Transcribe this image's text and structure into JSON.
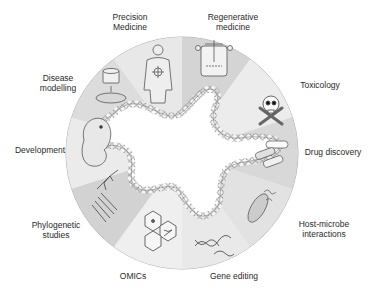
{
  "diagram": {
    "center": "intestinal organoid",
    "colors": {
      "sector_light": "#ececec",
      "sector_mid": "#dedede",
      "sector_dark": "#cfcfcf",
      "outline": "#555555",
      "text": "#2a2a2a"
    },
    "applications": [
      {
        "id": "precision-medicine",
        "line1": "Precision",
        "line2": "Medicine",
        "icon": "human-body-target-icon"
      },
      {
        "id": "regenerative-medicine",
        "line1": "Regenerative",
        "line2": "medicine",
        "icon": "bioreactor-flask-icon"
      },
      {
        "id": "toxicology",
        "line1": "Toxicology",
        "line2": "",
        "icon": "skull-crossbones-icon"
      },
      {
        "id": "drug-discovery",
        "line1": "Drug discovery",
        "line2": "",
        "icon": "pill-capsules-icon"
      },
      {
        "id": "host-microbe",
        "line1": "Host-microbe",
        "line2": "interactions",
        "icon": "bacterium-icon"
      },
      {
        "id": "gene-editing",
        "line1": "Gene editing",
        "line2": "",
        "icon": "dna-scissors-icon"
      },
      {
        "id": "omics",
        "line1": "OMICs",
        "line2": "",
        "icon": "hexagon-molecules-icon"
      },
      {
        "id": "phylogenetic",
        "line1": "Phylogenetic",
        "line2": "studies",
        "icon": "phylogenetic-tree-icon"
      },
      {
        "id": "development",
        "line1": "Development",
        "line2": "",
        "icon": "embryo-icon"
      },
      {
        "id": "disease-modelling",
        "line1": "Disease",
        "line2": "modelling",
        "icon": "culture-dish-icon"
      }
    ]
  }
}
